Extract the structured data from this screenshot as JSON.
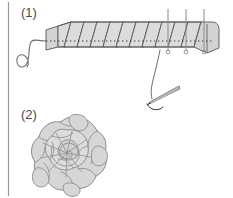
{
  "figure": {
    "background_color": "#ffffff",
    "width": 233,
    "height": 198,
    "border": {
      "name": "left-margin-rule",
      "color": "#9a9a9a",
      "x": 8,
      "y_start": 2,
      "y_end": 196,
      "width": 1.2
    }
  },
  "steps": [
    {
      "label": "(1)",
      "name": "step-one",
      "caption": "Pleated ribbon strip pinned and basted along lower edge",
      "label_x": 21,
      "label_y": 5
    },
    {
      "label": "(2)",
      "name": "step-two",
      "caption": "Finished gathered ribbon rose",
      "label_x": 21,
      "label_y": 107
    }
  ],
  "colors": {
    "ribbon_fill": "#d3d3d3",
    "ribbon_fill_light": "#dcdcdc",
    "ribbon_fill_shadow": "#c2c2c2",
    "outline": "#555555",
    "outline_soft": "#767676",
    "stitch": "#3c3c3c",
    "pin": "#8a8a8a",
    "needle_dark": "#2f2f2f",
    "needle_light": "#b5b5b5",
    "thread": "#6f6f6f",
    "label_text": "#4a4a4a",
    "rose_fill": "#d6d6d6",
    "rose_outline": "#8c8c8c"
  },
  "ribbon_strip": {
    "name": "pleated-ribbon-strip",
    "left_end_x": 45,
    "right_end_x": 218,
    "top_y": 22,
    "bottom_y": 50,
    "pleat_count": 12,
    "pleat_slant_px": 7,
    "stitch_line": {
      "name": "running-stitch-line",
      "y": 41,
      "x_start": 46,
      "x_end": 214,
      "dash": "1.4 2.6"
    }
  },
  "pins": {
    "name": "pin-markers",
    "count": 3,
    "positions_x": [
      168,
      186,
      204
    ],
    "top_y": 9,
    "bottom_y": 53,
    "head_radius": 1.9,
    "head_y": 51
  },
  "needle": {
    "name": "sewing-needle",
    "tip_x": 148,
    "tip_y": 103,
    "eye_x": 178,
    "eye_y": 88,
    "thread_from_x": 160,
    "thread_from_y": 50
  },
  "rose": {
    "name": "ribbon-rose",
    "center_x": 67,
    "center_y": 155,
    "outer_radius": 38,
    "petal_rings": 4
  }
}
